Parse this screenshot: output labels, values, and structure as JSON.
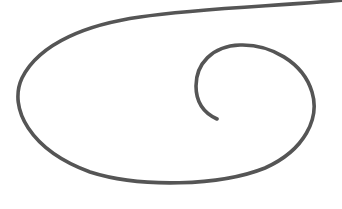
{
  "canvas": {
    "width": 342,
    "height": 209,
    "background": "#ffffff"
  },
  "spiral": {
    "stroke_color": "#555555",
    "stroke_width": 3.6,
    "path": "M 343 0 C 280 6, 200 8, 140 17 C 90 24, 40 42, 22 78 C 8 108, 30 150, 90 172 C 140 188, 220 186, 265 168 C 305 150, 320 118, 312 92 C 303 62, 270 44, 240 45 C 212 46, 196 64, 196 86 C 196 104, 206 114, 217 119"
  }
}
